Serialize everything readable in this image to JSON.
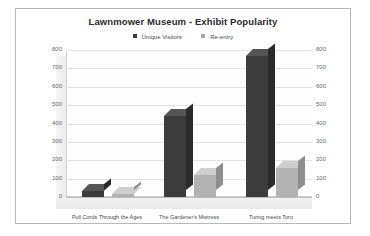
{
  "chart_data": {
    "type": "bar",
    "title": "Lawnmower Museum - Exhibit Popularity",
    "xlabel": "",
    "ylabel": "",
    "categories": [
      "Pull Cords Through the Ages",
      "The Gardener's Mistress",
      "Turing meets Toro"
    ],
    "series": [
      {
        "name": "Unique Visitors",
        "color": "#3c3c3c",
        "values": [
          35,
          440,
          770
        ]
      },
      {
        "name": "Re-entry",
        "color": "#b2b2b2",
        "values": [
          15,
          120,
          160
        ]
      }
    ],
    "ylim": [
      0,
      800
    ],
    "ystep": 100,
    "yticks": [
      800,
      700,
      600,
      500,
      400,
      300,
      200,
      100,
      0
    ],
    "secondary_axis": true,
    "secondary_yticks": [
      800,
      700,
      600,
      500,
      400,
      300,
      200,
      100,
      0
    ],
    "grid": true,
    "legend_position": "top",
    "style": "3d-clustered-column"
  }
}
